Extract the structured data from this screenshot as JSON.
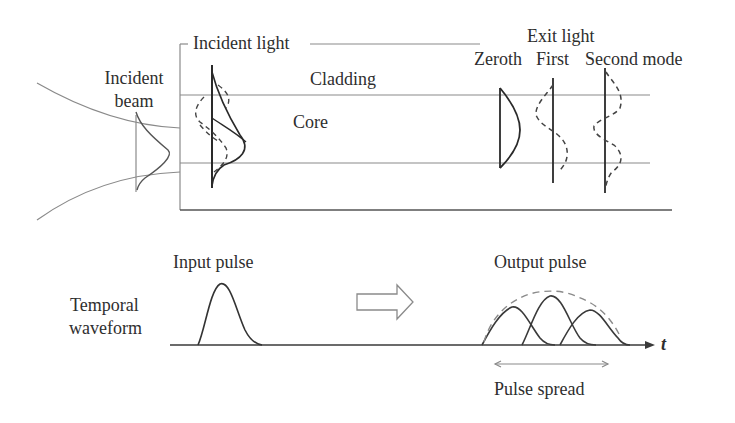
{
  "figure": {
    "top_panel": {
      "labels": {
        "incident_light": "Incident light",
        "incident_beam_line1": "Incident",
        "incident_beam_line2": "beam",
        "cladding": "Cladding",
        "core": "Core",
        "exit_light": "Exit light",
        "zeroth": "Zeroth",
        "first": "First",
        "second_mode": "Second mode"
      }
    },
    "bottom_panel": {
      "labels": {
        "input_pulse": "Input pulse",
        "temporal_line1": "Temporal",
        "temporal_line2": "waveform",
        "output_pulse": "Output pulse",
        "time_axis": "t",
        "pulse_spread": "Pulse spread"
      }
    },
    "colors": {
      "line": "#2a2a2a",
      "guide": "#9a9a9a",
      "dashed": "#444444"
    }
  }
}
